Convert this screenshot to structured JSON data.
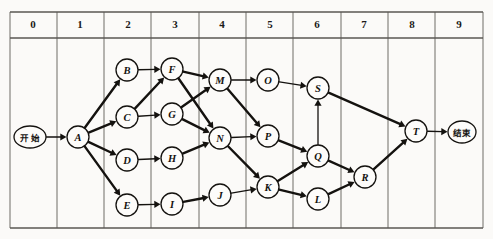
{
  "diagram": {
    "type": "layered-directed-graph",
    "canvas": {
      "width": 493,
      "height": 239
    },
    "colors": {
      "background": "#fbfaf8",
      "ink": "#14120f",
      "grid": "#6f6c67",
      "node_fill": "#fdfcfa"
    },
    "grid": {
      "label_row_top": 12,
      "label_row_bottom": 38,
      "frame_bottom": 228,
      "left": 10,
      "right": 483,
      "column_width": 47.3,
      "columns": [
        {
          "label": "0",
          "x": 33
        },
        {
          "label": "1",
          "x": 80
        },
        {
          "label": "2",
          "x": 128
        },
        {
          "label": "3",
          "x": 175
        },
        {
          "label": "4",
          "x": 222
        },
        {
          "label": "5",
          "x": 270
        },
        {
          "label": "6",
          "x": 317
        },
        {
          "label": "7",
          "x": 364
        },
        {
          "label": "8",
          "x": 412
        },
        {
          "label": "9",
          "x": 459
        }
      ],
      "verticals": [
        10,
        57,
        104,
        151,
        199,
        246,
        293,
        341,
        388,
        435,
        483
      ]
    },
    "terminals": [
      {
        "id": "start",
        "label": "开 始",
        "cx": 30,
        "cy": 137,
        "rx": 16,
        "ry": 11
      },
      {
        "id": "end",
        "label": "结束",
        "cx": 462,
        "cy": 132,
        "rx": 14,
        "ry": 11
      }
    ],
    "nodes": [
      {
        "id": "A",
        "label": "A",
        "cx": 78,
        "cy": 137,
        "r": 11,
        "column": 1
      },
      {
        "id": "B",
        "label": "B",
        "cx": 127,
        "cy": 70,
        "r": 11,
        "column": 2
      },
      {
        "id": "C",
        "label": "C",
        "cx": 127,
        "cy": 117,
        "r": 11,
        "column": 2
      },
      {
        "id": "D",
        "label": "D",
        "cx": 127,
        "cy": 160,
        "r": 11,
        "column": 2
      },
      {
        "id": "E",
        "label": "E",
        "cx": 127,
        "cy": 205,
        "r": 11,
        "column": 2
      },
      {
        "id": "F",
        "label": "F",
        "cx": 172,
        "cy": 69,
        "r": 11,
        "column": 3
      },
      {
        "id": "G",
        "label": "G",
        "cx": 172,
        "cy": 114,
        "r": 11,
        "column": 3
      },
      {
        "id": "H",
        "label": "H",
        "cx": 172,
        "cy": 158,
        "r": 11,
        "column": 3
      },
      {
        "id": "I",
        "label": "I",
        "cx": 172,
        "cy": 204,
        "r": 11,
        "column": 3
      },
      {
        "id": "M",
        "label": "M",
        "cx": 220,
        "cy": 80,
        "r": 11,
        "column": 4
      },
      {
        "id": "N",
        "label": "N",
        "cx": 220,
        "cy": 138,
        "r": 11,
        "column": 4
      },
      {
        "id": "J",
        "label": "J",
        "cx": 220,
        "cy": 195,
        "r": 11,
        "column": 4
      },
      {
        "id": "O",
        "label": "O",
        "cx": 268,
        "cy": 80,
        "r": 11,
        "column": 5
      },
      {
        "id": "P",
        "label": "P",
        "cx": 268,
        "cy": 136,
        "r": 11,
        "column": 5
      },
      {
        "id": "K",
        "label": "K",
        "cx": 268,
        "cy": 187,
        "r": 11,
        "column": 5
      },
      {
        "id": "S",
        "label": "S",
        "cx": 318,
        "cy": 88,
        "r": 11,
        "column": 6
      },
      {
        "id": "Q",
        "label": "Q",
        "cx": 318,
        "cy": 156,
        "r": 11,
        "column": 6
      },
      {
        "id": "L",
        "label": "L",
        "cx": 318,
        "cy": 199,
        "r": 11,
        "column": 6
      },
      {
        "id": "R",
        "label": "R",
        "cx": 365,
        "cy": 177,
        "r": 11,
        "column": 7
      },
      {
        "id": "T",
        "label": "T",
        "cx": 416,
        "cy": 131,
        "r": 11,
        "column": 8
      }
    ],
    "edges": [
      {
        "from": "start",
        "to": "A",
        "weight": "thin"
      },
      {
        "from": "A",
        "to": "B",
        "weight": "thick"
      },
      {
        "from": "A",
        "to": "C",
        "weight": "thick"
      },
      {
        "from": "A",
        "to": "D",
        "weight": "thick"
      },
      {
        "from": "A",
        "to": "E",
        "weight": "thick"
      },
      {
        "from": "B",
        "to": "F",
        "weight": "thin"
      },
      {
        "from": "C",
        "to": "F",
        "weight": "thick"
      },
      {
        "from": "C",
        "to": "G",
        "weight": "thin"
      },
      {
        "from": "D",
        "to": "H",
        "weight": "thin"
      },
      {
        "from": "E",
        "to": "I",
        "weight": "thin"
      },
      {
        "from": "F",
        "to": "M",
        "weight": "thick"
      },
      {
        "from": "F",
        "to": "N",
        "weight": "thick"
      },
      {
        "from": "G",
        "to": "M",
        "weight": "thick"
      },
      {
        "from": "G",
        "to": "N",
        "weight": "thick"
      },
      {
        "from": "H",
        "to": "N",
        "weight": "thick"
      },
      {
        "from": "I",
        "to": "J",
        "weight": "thick"
      },
      {
        "from": "M",
        "to": "O",
        "weight": "thin"
      },
      {
        "from": "M",
        "to": "P",
        "weight": "thick"
      },
      {
        "from": "N",
        "to": "P",
        "weight": "thin"
      },
      {
        "from": "N",
        "to": "K",
        "weight": "thick"
      },
      {
        "from": "J",
        "to": "K",
        "weight": "thin"
      },
      {
        "from": "O",
        "to": "S",
        "weight": "thin"
      },
      {
        "from": "P",
        "to": "Q",
        "weight": "thick"
      },
      {
        "from": "K",
        "to": "Q",
        "weight": "thick"
      },
      {
        "from": "K",
        "to": "L",
        "weight": "thick"
      },
      {
        "from": "Q",
        "to": "S",
        "weight": "thin"
      },
      {
        "from": "Q",
        "to": "R",
        "weight": "thick"
      },
      {
        "from": "L",
        "to": "R",
        "weight": "thick"
      },
      {
        "from": "S",
        "to": "T",
        "weight": "thick"
      },
      {
        "from": "R",
        "to": "T",
        "weight": "thick"
      },
      {
        "from": "T",
        "to": "end",
        "weight": "thin"
      }
    ]
  }
}
